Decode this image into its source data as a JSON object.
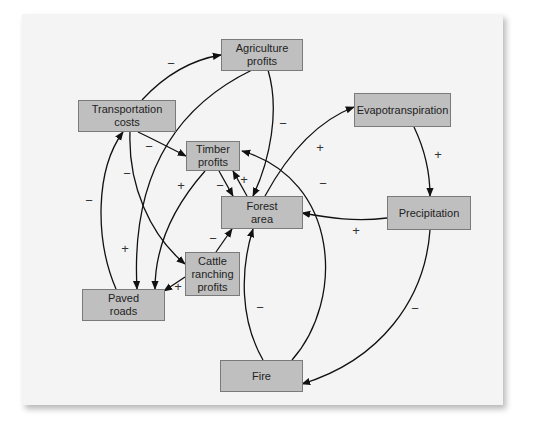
{
  "diagram": {
    "type": "causal-loop-diagram",
    "colors": {
      "panel_bg": "#f4f4f4",
      "node_fill": "#bfbfbf",
      "node_border": "#7a7a7a",
      "arrow": "#111111"
    },
    "nodes": {
      "agriculture_profits": "Agriculture\nprofits",
      "transportation_costs": "Transportation\ncosts",
      "timber_profits": "Timber\nprofits",
      "forest_area": "Forest\narea",
      "evapotranspiration": "Evapotranspiration",
      "precipitation": "Precipitation",
      "cattle_ranching_profits": "Cattle\nranching\nprofits",
      "paved_roads": "Paved\nroads",
      "fire": "Fire"
    },
    "edges": [
      {
        "from": "Transportation costs",
        "to": "Agriculture profits",
        "sign": "−"
      },
      {
        "from": "Transportation costs",
        "to": "Timber profits",
        "sign": "−"
      },
      {
        "from": "Transportation costs",
        "to": "Cattle ranching profits",
        "sign": "−"
      },
      {
        "from": "Paved roads",
        "to": "Transportation costs",
        "sign": "−"
      },
      {
        "from": "Agriculture profits",
        "to": "Paved roads",
        "sign": "+"
      },
      {
        "from": "Agriculture profits",
        "to": "Forest area",
        "sign": "−"
      },
      {
        "from": "Timber profits",
        "to": "Paved roads",
        "sign": "+"
      },
      {
        "from": "Timber profits",
        "to": "Forest area",
        "sign": "−"
      },
      {
        "from": "Forest area",
        "to": "Timber profits",
        "sign": "+"
      },
      {
        "from": "Cattle ranching profits",
        "to": "Paved roads",
        "sign": "+"
      },
      {
        "from": "Cattle ranching profits",
        "to": "Forest area",
        "sign": "−"
      },
      {
        "from": "Forest area",
        "to": "Evapotranspiration",
        "sign": "+"
      },
      {
        "from": "Evapotranspiration",
        "to": "Precipitation",
        "sign": "+"
      },
      {
        "from": "Precipitation",
        "to": "Forest area",
        "sign": "+"
      },
      {
        "from": "Precipitation",
        "to": "Fire",
        "sign": "−"
      },
      {
        "from": "Fire",
        "to": "Forest area",
        "sign": "−"
      },
      {
        "from": "Fire",
        "to": "Timber profits",
        "sign": "−"
      }
    ],
    "signs": {
      "transport_agri": "−",
      "transport_timber": "−",
      "transport_cattle": "−",
      "paved_transport": "−",
      "agri_paved": "+",
      "agri_forest": "−",
      "timber_paved": "+",
      "timber_forest": "−",
      "forest_timber": "+",
      "cattle_paved": "+",
      "cattle_forest": "−",
      "forest_evapo": "+",
      "evapo_precip": "+",
      "precip_forest": "+",
      "precip_fire": "−",
      "fire_forest": "−",
      "fire_timber": "−"
    }
  }
}
